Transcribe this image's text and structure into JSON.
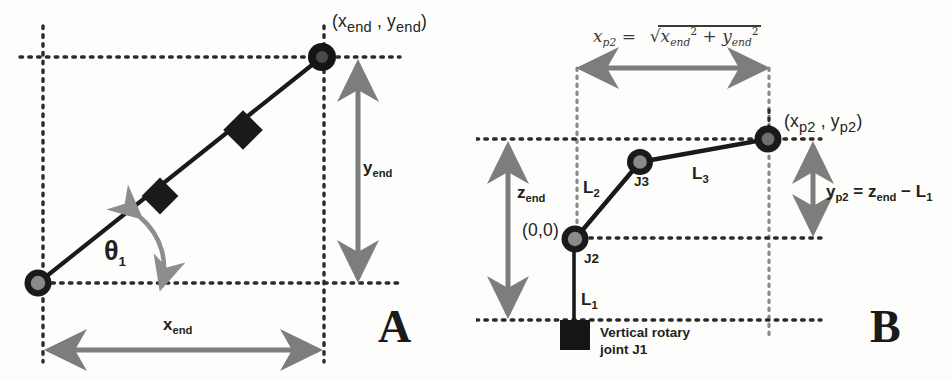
{
  "figure": {
    "panels": [
      {
        "letter": "A",
        "caption_labels": {
          "j1": "Vertical rotary\njoint J1",
          "j1_line1": "Vertical rotary",
          "j1_line2": "joint J1",
          "j2_line1": "Rotary planar",
          "j2_line2": "joint J2",
          "j3_line1": "Rotary planar",
          "j3_line2": "joint J3"
        },
        "endpoint_label": "(x",
        "endpoint_sub1": "end",
        "endpoint_mid": " , y",
        "endpoint_sub2": "end",
        "endpoint_close": ")",
        "x_dim": "x",
        "x_dim_sub": "end",
        "y_dim": "y",
        "y_dim_sub": "end",
        "angle": "θ",
        "angle_sub": "1"
      },
      {
        "letter": "B",
        "formula": {
          "lhs": "x",
          "lhs_sub": "p2",
          "equals": "=",
          "radicand_a": "x",
          "radicand_a_sub": "end",
          "radicand_a_sup": "2",
          "plus": "+",
          "radicand_b": "y",
          "radicand_b_sub": "end",
          "radicand_b_sup": "2"
        },
        "endpoint_label": "(x",
        "endpoint_sub1": "p2",
        "endpoint_mid": " , y",
        "endpoint_sub2": "p2",
        "endpoint_close": ")",
        "origin": "(0,0)",
        "j1_line1": "Vertical rotary",
        "j1_line2": "joint J1",
        "j2": "J2",
        "j3": "J3",
        "link1": "L",
        "link1_sub": "1",
        "link2": "L",
        "link2_sub": "2",
        "link3": "L",
        "link3_sub": "3",
        "z_dim": "z",
        "z_dim_sub": "end",
        "y_relation_lhs": "y",
        "y_relation_lhs_sub": "p2",
        "y_relation_eq": " = z",
        "y_relation_sub2": "end",
        "y_relation_minus": " − L",
        "y_relation_sub3": "1"
      }
    ],
    "colors": {
      "ink": "#231f20",
      "link_line": "#1a1a1a",
      "dotted_guide": "#2b2b2b",
      "dim_arrow": "#7d7d7d",
      "joint_fill": "#8a8a8a",
      "joint_stroke": "#1a1a1a",
      "background": "#fdfdfb"
    }
  }
}
